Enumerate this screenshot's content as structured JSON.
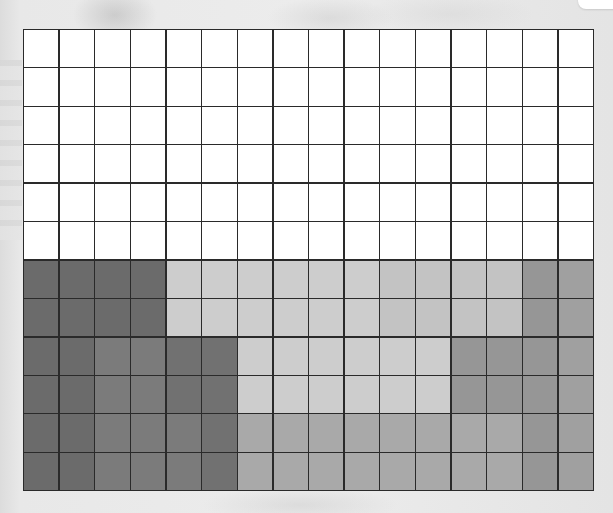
{
  "grid": {
    "rows": 12,
    "columns": 16,
    "line_color": "#2a2a2a",
    "palette": {
      "W": "#ffffff",
      "D": "#6b6b6b",
      "d": "#717171",
      "M": "#7b7b7b",
      "L": "#cdcdcd",
      "l": "#c3c3c3",
      "T": "#a9a9a9",
      "G": "#969696",
      "g": "#a0a0a0"
    },
    "cells": [
      [
        "W",
        "W",
        "W",
        "W",
        "W",
        "W",
        "W",
        "W",
        "W",
        "W",
        "W",
        "W",
        "W",
        "W",
        "W",
        "W"
      ],
      [
        "W",
        "W",
        "W",
        "W",
        "W",
        "W",
        "W",
        "W",
        "W",
        "W",
        "W",
        "W",
        "W",
        "W",
        "W",
        "W"
      ],
      [
        "W",
        "W",
        "W",
        "W",
        "W",
        "W",
        "W",
        "W",
        "W",
        "W",
        "W",
        "W",
        "W",
        "W",
        "W",
        "W"
      ],
      [
        "W",
        "W",
        "W",
        "W",
        "W",
        "W",
        "W",
        "W",
        "W",
        "W",
        "W",
        "W",
        "W",
        "W",
        "W",
        "W"
      ],
      [
        "W",
        "W",
        "W",
        "W",
        "W",
        "W",
        "W",
        "W",
        "W",
        "W",
        "W",
        "W",
        "W",
        "W",
        "W",
        "W"
      ],
      [
        "W",
        "W",
        "W",
        "W",
        "W",
        "W",
        "W",
        "W",
        "W",
        "W",
        "W",
        "W",
        "W",
        "W",
        "W",
        "W"
      ],
      [
        "D",
        "D",
        "D",
        "D",
        "L",
        "L",
        "L",
        "L",
        "L",
        "L",
        "l",
        "l",
        "l",
        "l",
        "G",
        "g"
      ],
      [
        "D",
        "D",
        "D",
        "D",
        "L",
        "L",
        "L",
        "L",
        "L",
        "L",
        "l",
        "l",
        "l",
        "l",
        "G",
        "g"
      ],
      [
        "D",
        "D",
        "M",
        "M",
        "d",
        "d",
        "L",
        "L",
        "L",
        "L",
        "L",
        "L",
        "G",
        "G",
        "G",
        "g"
      ],
      [
        "D",
        "D",
        "M",
        "M",
        "d",
        "d",
        "L",
        "L",
        "L",
        "L",
        "L",
        "L",
        "G",
        "G",
        "G",
        "g"
      ],
      [
        "D",
        "D",
        "M",
        "M",
        "M",
        "d",
        "T",
        "T",
        "T",
        "T",
        "T",
        "T",
        "T",
        "T",
        "G",
        "g"
      ],
      [
        "D",
        "D",
        "M",
        "M",
        "M",
        "d",
        "T",
        "T",
        "T",
        "T",
        "T",
        "T",
        "T",
        "T",
        "G",
        "g"
      ]
    ]
  }
}
